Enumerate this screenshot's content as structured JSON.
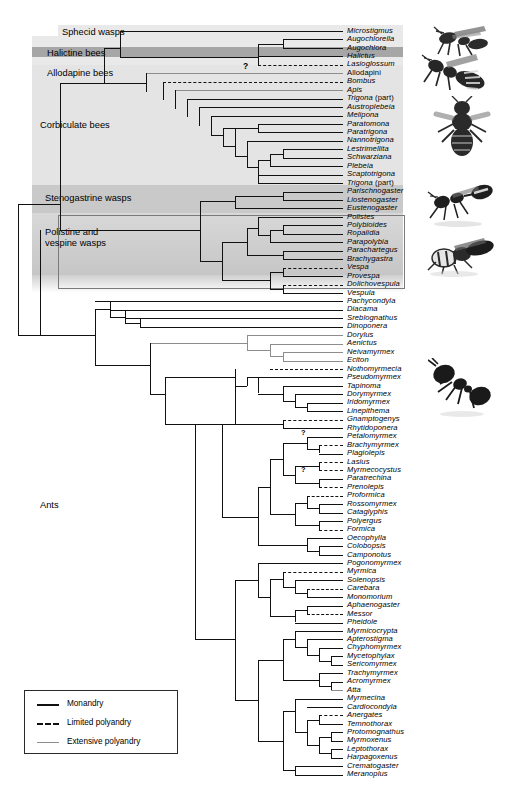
{
  "figure": {
    "type": "phylogenetic-cladogram",
    "title": "",
    "tip_count": 80
  },
  "groups": [
    {
      "name": "Sphecid wasps",
      "label": "Sphecid wasps",
      "band": "light",
      "top": 25,
      "height": 11
    },
    {
      "name": "Halictine bees",
      "label": "Halictine bees",
      "band": "dark",
      "top": 47,
      "height": 10
    },
    {
      "name": "Allodapine bees",
      "label": "Allodapine bees",
      "band": "light",
      "top": 57,
      "height": 12
    },
    {
      "name": "Corbiculate bees",
      "label": "Corbiculate bees",
      "band": "light",
      "top": 69,
      "height": 116
    },
    {
      "name": "Stenogastrine wasps",
      "label": "Stenogastrine wasps",
      "band": "mid",
      "top": 185,
      "height": 28
    },
    {
      "name": "Polistine and vespine wasps",
      "label": "Polistine and\nvespine wasps",
      "band": "grad",
      "top": 213,
      "height": 75
    },
    {
      "name": "Ants",
      "label": "Ants",
      "band": "none",
      "top": 290,
      "height": 0
    }
  ],
  "legend": {
    "items": [
      {
        "label": "Monandry",
        "style": "solid-black",
        "color": "#111111"
      },
      {
        "label": "Limited polyandry",
        "style": "dashed-black",
        "color": "#111111"
      },
      {
        "label": "Extensive polyandry",
        "style": "solid-grey",
        "color": "#8d8d8d"
      }
    ]
  },
  "annotations": [
    {
      "name": "allodapini-uncertainty",
      "symbol": "?",
      "x": 243,
      "y": 66
    },
    {
      "name": "brachymyrmex-uncertainty",
      "symbol": "?",
      "x": 301,
      "y": 433
    },
    {
      "name": "prenolepis-uncertainty",
      "symbol": "?",
      "x": 301,
      "y": 470
    }
  ],
  "photos": [
    {
      "name": "sphecid-wasp-photo",
      "x": 424,
      "y": 24,
      "w": 72,
      "h": 40
    },
    {
      "name": "halictine-bee-photo",
      "x": 420,
      "y": 52,
      "w": 76,
      "h": 44
    },
    {
      "name": "honey-bee-photo",
      "x": 430,
      "y": 96,
      "w": 62,
      "h": 62
    },
    {
      "name": "stenogastrine-wasp-photo",
      "x": 424,
      "y": 180,
      "w": 74,
      "h": 48
    },
    {
      "name": "vespine-wasp-photo",
      "x": 424,
      "y": 232,
      "w": 76,
      "h": 44
    },
    {
      "name": "ant-photo",
      "x": 428,
      "y": 358,
      "w": 68,
      "h": 62
    }
  ],
  "tips": [
    {
      "i": 0,
      "name": "Microstigmus",
      "style": "italic",
      "line": "monandry"
    },
    {
      "i": 1,
      "name": "Augochlorella",
      "style": "italic",
      "line": "monandry"
    },
    {
      "i": 2,
      "name": "Augochlora",
      "style": "italic",
      "line": "monandry"
    },
    {
      "i": 3,
      "name": "Halictus",
      "style": "italic",
      "line": "monandry"
    },
    {
      "i": 4,
      "name": "Lasioglossum",
      "style": "italic",
      "line": "limited"
    },
    {
      "i": 5,
      "name": "Allodapini",
      "style": "roman",
      "line": "extensive"
    },
    {
      "i": 6,
      "name": "Bombus",
      "style": "italic",
      "line": "limited"
    },
    {
      "i": 7,
      "name": "Apis",
      "style": "italic",
      "line": "extensive"
    },
    {
      "i": 8,
      "name": "Trigona (part)",
      "style": "italic-part",
      "line": "monandry"
    },
    {
      "i": 9,
      "name": "Austroplebeia",
      "style": "italic",
      "line": "monandry"
    },
    {
      "i": 10,
      "name": "Melipona",
      "style": "italic",
      "line": "monandry"
    },
    {
      "i": 11,
      "name": "Paratomona",
      "style": "italic",
      "line": "monandry"
    },
    {
      "i": 12,
      "name": "Paratrigona",
      "style": "italic",
      "line": "monandry"
    },
    {
      "i": 13,
      "name": "Nannotrigona",
      "style": "italic",
      "line": "monandry"
    },
    {
      "i": 14,
      "name": "Lestrimellita",
      "style": "italic",
      "line": "monandry"
    },
    {
      "i": 15,
      "name": "Schwarziana",
      "style": "italic",
      "line": "monandry"
    },
    {
      "i": 16,
      "name": "Plebeia",
      "style": "italic",
      "line": "monandry"
    },
    {
      "i": 17,
      "name": "Scaptotrigona",
      "style": "italic",
      "line": "monandry"
    },
    {
      "i": 18,
      "name": "Trigona (part)",
      "style": "italic-part",
      "line": "monandry"
    },
    {
      "i": 19,
      "name": "Parischnogaster",
      "style": "italic",
      "line": "monandry"
    },
    {
      "i": 20,
      "name": "Liostenogaster",
      "style": "italic",
      "line": "monandry"
    },
    {
      "i": 21,
      "name": "Eustenogaster",
      "style": "italic",
      "line": "monandry"
    },
    {
      "i": 22,
      "name": "Polistes",
      "style": "italic",
      "line": "monandry"
    },
    {
      "i": 23,
      "name": "Polybioides",
      "style": "italic",
      "line": "monandry"
    },
    {
      "i": 24,
      "name": "Ropalidia",
      "style": "italic",
      "line": "monandry"
    },
    {
      "i": 25,
      "name": "Parapolybia",
      "style": "italic",
      "line": "monandry"
    },
    {
      "i": 26,
      "name": "Parachartegus",
      "style": "italic",
      "line": "monandry"
    },
    {
      "i": 27,
      "name": "Brachygastra",
      "style": "italic",
      "line": "monandry"
    },
    {
      "i": 28,
      "name": "Vespa",
      "style": "italic",
      "line": "limited"
    },
    {
      "i": 29,
      "name": "Provespa",
      "style": "italic",
      "line": "monandry"
    },
    {
      "i": 30,
      "name": "Dolichovespula",
      "style": "italic",
      "line": "limited"
    },
    {
      "i": 31,
      "name": "Vespula",
      "style": "italic",
      "line": "monandry"
    },
    {
      "i": 32,
      "name": "Pachycondyla",
      "style": "italic",
      "line": "monandry"
    },
    {
      "i": 33,
      "name": "Diacama",
      "style": "italic",
      "line": "monandry"
    },
    {
      "i": 34,
      "name": "Sreblognathus",
      "style": "italic",
      "line": "monandry"
    },
    {
      "i": 35,
      "name": "Dinoponera",
      "style": "italic",
      "line": "monandry"
    },
    {
      "i": 36,
      "name": "Dorylus",
      "style": "italic",
      "line": "extensive"
    },
    {
      "i": 37,
      "name": "Aenictus",
      "style": "italic",
      "line": "extensive"
    },
    {
      "i": 38,
      "name": "Neivamyrmex",
      "style": "italic",
      "line": "extensive"
    },
    {
      "i": 39,
      "name": "Eciton",
      "style": "italic",
      "line": "extensive"
    },
    {
      "i": 40,
      "name": "Nothomyrmecia",
      "style": "italic",
      "line": "limited"
    },
    {
      "i": 41,
      "name": "Pseudomyrmex",
      "style": "italic",
      "line": "monandry"
    },
    {
      "i": 42,
      "name": "Tapinoma",
      "style": "italic",
      "line": "monandry"
    },
    {
      "i": 43,
      "name": "Dorymyrmex",
      "style": "italic",
      "line": "monandry"
    },
    {
      "i": 44,
      "name": "Iridomyrmex",
      "style": "italic",
      "line": "monandry"
    },
    {
      "i": 45,
      "name": "Linepithema",
      "style": "italic",
      "line": "monandry"
    },
    {
      "i": 46,
      "name": "Gnamptogenys",
      "style": "italic",
      "line": "limited"
    },
    {
      "i": 47,
      "name": "Rhytidoponera",
      "style": "italic",
      "line": "monandry"
    },
    {
      "i": 48,
      "name": "Petalomyrmex",
      "style": "italic",
      "line": "monandry"
    },
    {
      "i": 49,
      "name": "Brachymyrmex",
      "style": "italic",
      "line": "limited-q"
    },
    {
      "i": 50,
      "name": "Plagiolepis",
      "style": "italic",
      "line": "monandry"
    },
    {
      "i": 51,
      "name": "Lasius",
      "style": "italic",
      "line": "limited"
    },
    {
      "i": 52,
      "name": "Myrmecocystus",
      "style": "italic",
      "line": "limited"
    },
    {
      "i": 53,
      "name": "Paratrechina",
      "style": "italic",
      "line": "monandry"
    },
    {
      "i": 54,
      "name": "Prenolepis",
      "style": "italic",
      "line": "limited-q"
    },
    {
      "i": 55,
      "name": "Proformica",
      "style": "italic",
      "line": "limited"
    },
    {
      "i": 56,
      "name": "Rossomyrmex",
      "style": "italic",
      "line": "monandry"
    },
    {
      "i": 57,
      "name": "Cataglyphis",
      "style": "italic",
      "line": "monandry"
    },
    {
      "i": 58,
      "name": "Polyergus",
      "style": "italic",
      "line": "monandry"
    },
    {
      "i": 59,
      "name": "Formica",
      "style": "italic",
      "line": "limited"
    },
    {
      "i": 60,
      "name": "Oecophylla",
      "style": "italic",
      "line": "monandry"
    },
    {
      "i": 61,
      "name": "Colobopsis",
      "style": "italic",
      "line": "monandry"
    },
    {
      "i": 62,
      "name": "Camponotus",
      "style": "italic",
      "line": "monandry"
    },
    {
      "i": 63,
      "name": "Pogonomyrmex",
      "style": "italic",
      "line": "monandry"
    },
    {
      "i": 64,
      "name": "Myrmica",
      "style": "italic",
      "line": "limited"
    },
    {
      "i": 65,
      "name": "Solenopsis",
      "style": "italic",
      "line": "monandry"
    },
    {
      "i": 66,
      "name": "Carebara",
      "style": "italic",
      "line": "limited"
    },
    {
      "i": 67,
      "name": "Monomorium",
      "style": "italic",
      "line": "monandry"
    },
    {
      "i": 68,
      "name": "Aphaenogaster",
      "style": "italic",
      "line": "monandry"
    },
    {
      "i": 69,
      "name": "Messor",
      "style": "italic",
      "line": "limited"
    },
    {
      "i": 70,
      "name": "Pheidole",
      "style": "italic",
      "line": "monandry"
    },
    {
      "i": 71,
      "name": "Myrmicocrypta",
      "style": "italic",
      "line": "monandry"
    },
    {
      "i": 72,
      "name": "Apterostigma",
      "style": "italic",
      "line": "monandry"
    },
    {
      "i": 73,
      "name": "Chyphomyrmex",
      "style": "italic",
      "line": "monandry"
    },
    {
      "i": 74,
      "name": "Mycetophylax",
      "style": "italic",
      "line": "monandry"
    },
    {
      "i": 75,
      "name": "Sericomyrmex",
      "style": "italic",
      "line": "monandry"
    },
    {
      "i": 76,
      "name": "Trachymyrmex",
      "style": "italic",
      "line": "monandry"
    },
    {
      "i": 77,
      "name": "Acromyrmex",
      "style": "italic",
      "line": "monandry"
    },
    {
      "i": 78,
      "name": "Atta",
      "style": "italic",
      "line": "extensive"
    },
    {
      "i": 79,
      "name": "Myrmecina",
      "style": "italic",
      "line": "monandry"
    },
    {
      "i": 80,
      "name": "Cardiocondyla",
      "style": "italic",
      "line": "monandry"
    },
    {
      "i": 81,
      "name": "Anergates",
      "style": "italic",
      "line": "limited"
    },
    {
      "i": 82,
      "name": "Temnothorax",
      "style": "italic",
      "line": "monandry"
    },
    {
      "i": 83,
      "name": "Protomognathus",
      "style": "italic",
      "line": "monandry"
    },
    {
      "i": 84,
      "name": "Myrmoxenus",
      "style": "italic",
      "line": "monandry"
    },
    {
      "i": 85,
      "name": "Leptothorax",
      "style": "italic",
      "line": "monandry"
    },
    {
      "i": 86,
      "name": "Harpagoxenus",
      "style": "italic",
      "line": "monandry"
    },
    {
      "i": 87,
      "name": "Crematogaster",
      "style": "italic",
      "line": "monandry"
    },
    {
      "i": 88,
      "name": "Meranoplus",
      "style": "italic",
      "line": "monandry"
    }
  ]
}
